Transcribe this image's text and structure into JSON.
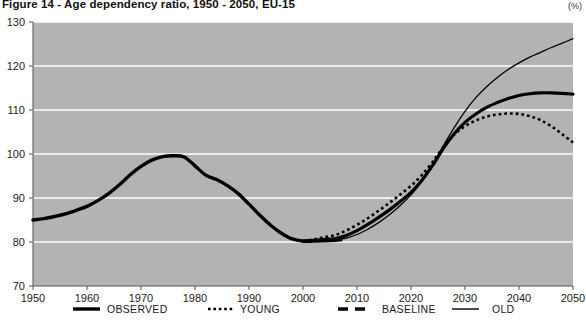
{
  "figure": {
    "title": "Figure 14 - Age dependency ratio, 1950 - 2050, EU-15",
    "unit": "(%)"
  },
  "chart_data": {
    "type": "line",
    "title": "Figure 14 - Age dependency ratio, 1950 - 2050, EU-15",
    "subtitle": "",
    "xlabel": "",
    "ylabel": "(%)",
    "xlim": [
      1950,
      2050
    ],
    "ylim": [
      70,
      130
    ],
    "xticks": [
      1950,
      1960,
      1970,
      1980,
      1990,
      2000,
      2010,
      2020,
      2030,
      2040,
      2050
    ],
    "yticks": [
      70,
      80,
      90,
      100,
      110,
      120,
      130
    ],
    "grid": "horizontal",
    "plot_background": "#b3b3b3",
    "gridline_color": "#ffffff",
    "legend_position": "bottom",
    "series": [
      {
        "name": "OBSERVED",
        "style": "solid",
        "width": 3.4,
        "color": "#000000",
        "x": [
          1950,
          1952,
          1954,
          1956,
          1958,
          1960,
          1962,
          1964,
          1966,
          1968,
          1970,
          1972,
          1974,
          1976,
          1978,
          1980,
          1982,
          1984,
          1986,
          1988,
          1990,
          1992,
          1994,
          1996,
          1998,
          2000,
          2002,
          2004,
          2006,
          2007
        ],
        "values": [
          85.0,
          85.3,
          85.8,
          86.4,
          87.2,
          88.1,
          89.4,
          91.0,
          93.0,
          95.3,
          97.2,
          98.6,
          99.4,
          99.6,
          99.3,
          97.3,
          95.2,
          94.2,
          92.8,
          91.0,
          88.6,
          86.1,
          83.8,
          82.0,
          80.7,
          80.2,
          80.2,
          80.3,
          80.4,
          80.5
        ]
      },
      {
        "name": "YOUNG",
        "style": "dotted",
        "width": 2.6,
        "color": "#000000",
        "x": [
          2000,
          2002,
          2004,
          2006,
          2008,
          2010,
          2012,
          2014,
          2016,
          2018,
          2020,
          2022,
          2024,
          2026,
          2028,
          2030,
          2032,
          2034,
          2036,
          2038,
          2040,
          2042,
          2044,
          2046,
          2048,
          2050
        ],
        "values": [
          80.2,
          80.6,
          81.1,
          81.6,
          82.6,
          83.9,
          85.4,
          87.1,
          88.9,
          90.8,
          92.8,
          95.2,
          98.2,
          101.6,
          104.4,
          106.3,
          107.6,
          108.5,
          109.0,
          109.2,
          109.1,
          108.6,
          107.7,
          106.3,
          104.5,
          102.6
        ]
      },
      {
        "name": "BASELINE",
        "style": "solid-thick",
        "width": 3.2,
        "color": "#000000",
        "x": [
          2000,
          2002,
          2004,
          2006,
          2008,
          2010,
          2012,
          2014,
          2016,
          2018,
          2020,
          2022,
          2024,
          2026,
          2028,
          2030,
          2032,
          2034,
          2036,
          2038,
          2040,
          2042,
          2044,
          2046,
          2048,
          2050
        ],
        "values": [
          80.2,
          80.4,
          80.6,
          80.8,
          81.5,
          82.6,
          84.0,
          85.6,
          87.3,
          89.2,
          91.3,
          94.0,
          97.4,
          101.3,
          104.6,
          107.2,
          109.1,
          110.6,
          111.7,
          112.6,
          113.3,
          113.7,
          113.9,
          113.9,
          113.8,
          113.6
        ]
      },
      {
        "name": "OLD",
        "style": "thin",
        "width": 1.3,
        "color": "#000000",
        "x": [
          2000,
          2002,
          2004,
          2006,
          2008,
          2010,
          2012,
          2014,
          2016,
          2018,
          2020,
          2022,
          2024,
          2026,
          2028,
          2030,
          2032,
          2034,
          2036,
          2038,
          2040,
          2042,
          2044,
          2046,
          2048,
          2050
        ],
        "values": [
          80.2,
          80.3,
          80.4,
          80.5,
          80.9,
          81.7,
          82.9,
          84.4,
          86.2,
          88.3,
          90.7,
          93.8,
          97.6,
          101.9,
          106.0,
          109.7,
          112.8,
          115.3,
          117.4,
          119.2,
          120.7,
          122.0,
          123.1,
          124.2,
          125.2,
          126.2
        ]
      }
    ],
    "legend": [
      {
        "label": "OBSERVED",
        "style": "solid-thick"
      },
      {
        "label": "YOUNG",
        "style": "dotted"
      },
      {
        "label": "BASELINE",
        "style": "dashed-thick"
      },
      {
        "label": "OLD",
        "style": "thin"
      }
    ]
  }
}
